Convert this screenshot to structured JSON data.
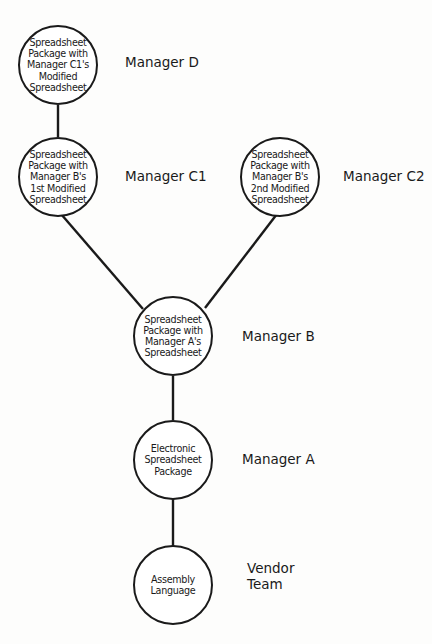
{
  "diagram": {
    "type": "tree",
    "colors": {
      "stroke": "#1a1a1a",
      "background": "#fdfdfc",
      "node_fill": "#ffffff"
    },
    "nodes": [
      {
        "id": "D",
        "text": "Spreadsheet\nPackage with\nManager C1's\nModified\nSpreadsheet",
        "role_label": "Manager D"
      },
      {
        "id": "C1",
        "text": "Spreadsheet\nPackage with\nManager B's\n1st Modified\nSpreadsheet",
        "role_label": "Manager C1"
      },
      {
        "id": "C2",
        "text": "Spreadsheet\nPackage with\nManager B's\n2nd Modified\nSpreadsheet",
        "role_label": "Manager C2"
      },
      {
        "id": "B",
        "text": "Spreadsheet\nPackage with\nManager A's\nSpreadsheet",
        "role_label": "Manager B"
      },
      {
        "id": "A",
        "text": "Electronic\nSpreadsheet\nPackage",
        "role_label": "Manager A"
      },
      {
        "id": "V",
        "text": "Assembly\nLanguage",
        "role_label": "Vendor\nTeam"
      }
    ],
    "edges": [
      {
        "from": "V",
        "to": "A"
      },
      {
        "from": "A",
        "to": "B"
      },
      {
        "from": "B",
        "to": "C1"
      },
      {
        "from": "B",
        "to": "C2"
      },
      {
        "from": "C1",
        "to": "D"
      }
    ]
  }
}
